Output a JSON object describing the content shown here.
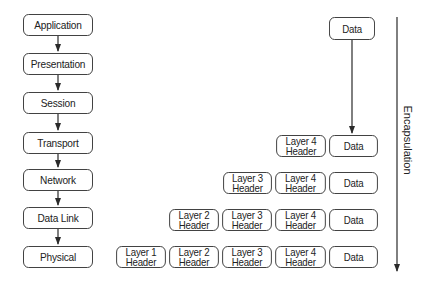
{
  "osi_layers": [
    {
      "label": "Application",
      "top": 14
    },
    {
      "label": "Presentation",
      "top": 53
    },
    {
      "label": "Session",
      "top": 92
    },
    {
      "label": "Transport",
      "top": 132
    },
    {
      "label": "Network",
      "top": 169
    },
    {
      "label": "Data Link",
      "top": 207
    },
    {
      "label": "Physical",
      "top": 246
    }
  ],
  "data_box": {
    "label": "Data"
  },
  "encapsulation_rows": [
    {
      "level": "Transport",
      "segments": [
        "Layer 4\nHeader",
        "Data"
      ]
    },
    {
      "level": "Network",
      "segments": [
        "Layer 3\nHeader",
        "Layer 4\nHeader",
        "Data"
      ]
    },
    {
      "level": "Data Link",
      "segments": [
        "Layer 2\nHeader",
        "Layer 3\nHeader",
        "Layer 4\nHeader",
        "Data"
      ]
    },
    {
      "level": "Physical",
      "segments": [
        "Layer 1\nHeader",
        "Layer 2\nHeader",
        "Layer 3\nHeader",
        "Layer 4\nHeader",
        "Data"
      ]
    }
  ],
  "axis_label": "Encapsulation"
}
